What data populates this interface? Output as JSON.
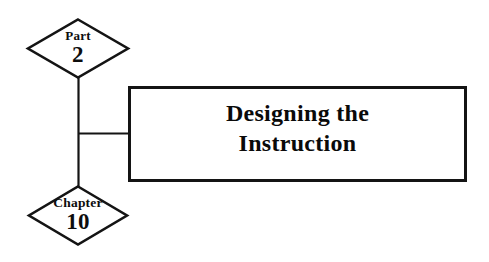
{
  "diagram": {
    "type": "textbook-part-chapter-opener",
    "background_color": "#ffffff",
    "line_color": "#141414",
    "text_color": "#0d0d0d",
    "part_node": {
      "shape": "diamond",
      "kind_label": "Part",
      "number_label": "2"
    },
    "chapter_node": {
      "shape": "diamond",
      "kind_label": "Chapter",
      "number_label": "10"
    },
    "title_box": {
      "shape": "rectangle",
      "title_line_1": "Designing the",
      "title_line_2": "Instruction"
    }
  }
}
